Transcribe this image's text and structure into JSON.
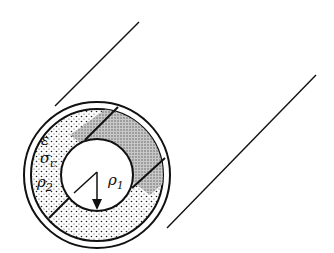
{
  "diagram": {
    "labels": {
      "epsilon": "ε",
      "sigma": "σ",
      "sigma_sub": "c",
      "rho2": "ρ",
      "rho2_sub": "2",
      "rho1": "ρ",
      "rho1_sub": "1"
    },
    "colors": {
      "stroke": "#111111",
      "background": "#ffffff"
    }
  }
}
